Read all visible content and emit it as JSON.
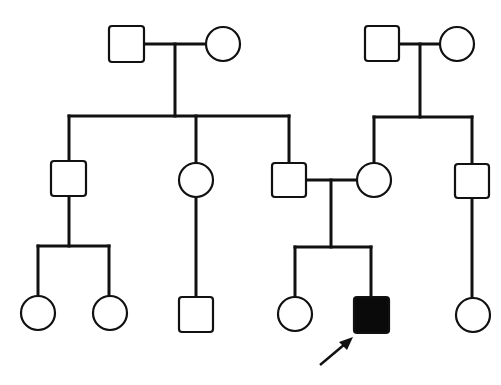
{
  "colors": {
    "line": "#111111",
    "unaffected_fill": "#ffffff",
    "affected_fill": "#0a0a0a",
    "background": "#ffffff"
  },
  "legend": {
    "square": "male",
    "circle": "female",
    "filled": "affected",
    "arrow": "proband"
  },
  "generations": [
    {
      "id": "I",
      "individuals": [
        {
          "id": "I-1",
          "sex": "male",
          "affected": false,
          "label": ""
        },
        {
          "id": "I-2",
          "sex": "female",
          "affected": false,
          "label": ""
        },
        {
          "id": "I-3",
          "sex": "male",
          "affected": false,
          "label": ""
        },
        {
          "id": "I-4",
          "sex": "female",
          "affected": false,
          "label": ""
        }
      ]
    },
    {
      "id": "II",
      "individuals": [
        {
          "id": "II-1",
          "sex": "male",
          "affected": false,
          "label": ""
        },
        {
          "id": "II-2",
          "sex": "female",
          "affected": false,
          "label": ""
        },
        {
          "id": "II-3",
          "sex": "male",
          "affected": false,
          "label": ""
        },
        {
          "id": "II-4",
          "sex": "female",
          "affected": false,
          "label": ""
        },
        {
          "id": "II-5",
          "sex": "male",
          "affected": false,
          "label": ""
        }
      ]
    },
    {
      "id": "III",
      "individuals": [
        {
          "id": "III-1",
          "sex": "female",
          "affected": false,
          "label": ""
        },
        {
          "id": "III-2",
          "sex": "female",
          "affected": false,
          "label": ""
        },
        {
          "id": "III-3",
          "sex": "male",
          "affected": false,
          "label": ""
        },
        {
          "id": "III-4",
          "sex": "female",
          "affected": false,
          "label": ""
        },
        {
          "id": "III-5",
          "sex": "male",
          "affected": true,
          "label": "",
          "proband": true
        },
        {
          "id": "III-6",
          "sex": "female",
          "affected": false,
          "label": ""
        }
      ]
    }
  ],
  "matings": [
    {
      "between": [
        "I-1",
        "I-2"
      ],
      "children": [
        "II-1",
        "II-2",
        "II-3"
      ]
    },
    {
      "between": [
        "I-3",
        "I-4"
      ],
      "children": [
        "II-4",
        "II-5"
      ]
    },
    {
      "between": [
        "II-3",
        "II-4"
      ],
      "children": [
        "III-4",
        "III-5"
      ]
    }
  ],
  "descent_lines": [
    {
      "parent": "II-1",
      "children": [
        "III-1",
        "III-2"
      ]
    },
    {
      "parent": "II-2",
      "children": [
        "III-3"
      ]
    },
    {
      "parent": "II-5",
      "children": [
        "III-6"
      ]
    }
  ],
  "proband_marker": {
    "target": "III-5",
    "icon": "arrow-icon"
  }
}
